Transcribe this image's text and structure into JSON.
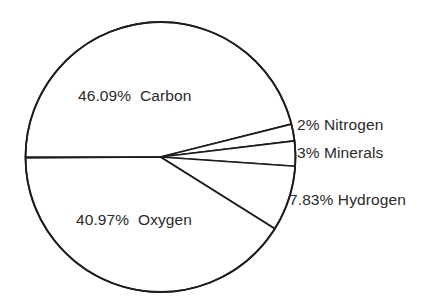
{
  "chart_data": {
    "type": "pie",
    "title": "",
    "subtitle": "",
    "xlabel": "",
    "ylabel": "",
    "grid": false,
    "legend_position": "none",
    "labels_inside": [
      "Carbon",
      "Oxygen"
    ],
    "labels_outside": [
      "Nitrogen",
      "Minerals",
      "Hydrogen"
    ],
    "categories": [
      "Carbon",
      "Oxygen",
      "Hydrogen",
      "Minerals",
      "Nitrogen"
    ],
    "values": [
      46.09,
      40.97,
      7.83,
      3,
      2
    ],
    "value_unit": "%",
    "slices": [
      {
        "name": "Carbon",
        "value": 46.09,
        "percent_text": "46.09%",
        "label": "46.09%  Carbon",
        "label_placement": "inside",
        "start_angle_deg": 180,
        "sweep_deg": 165.92,
        "fill": "#ffffff",
        "stroke": "#1d1d1d"
      },
      {
        "name": "Nitrogen",
        "value": 2,
        "percent_text": "2%",
        "label": "2% Nitrogen",
        "label_placement": "outside",
        "start_angle_deg": 345.92,
        "sweep_deg": 7.2,
        "fill": "#ffffff",
        "stroke": "#1d1d1d"
      },
      {
        "name": "Minerals",
        "value": 3,
        "percent_text": "3%",
        "label": "3% Minerals",
        "label_placement": "outside",
        "start_angle_deg": 353.12,
        "sweep_deg": 10.8,
        "fill": "#ffffff",
        "stroke": "#1d1d1d"
      },
      {
        "name": "Hydrogen",
        "value": 7.83,
        "percent_text": "7.83%",
        "label": "7.83% Hydrogen",
        "label_placement": "outside",
        "start_angle_deg": 363.92,
        "sweep_deg": 28.19,
        "fill": "#ffffff",
        "stroke": "#1d1d1d"
      },
      {
        "name": "Oxygen",
        "value": 40.97,
        "percent_text": "40.97%",
        "label": "40.97%  Oxygen",
        "label_placement": "inside",
        "start_angle_deg": 392.11,
        "sweep_deg": 147.49,
        "fill": "#ffffff",
        "stroke": "#1d1d1d"
      }
    ],
    "geometry": {
      "center_x": 160.5,
      "center_y": 157,
      "radius": 135
    },
    "colors": {
      "background": "#ffffff",
      "stroke": "#1d1d1d",
      "text": "#2b2b2b"
    }
  }
}
